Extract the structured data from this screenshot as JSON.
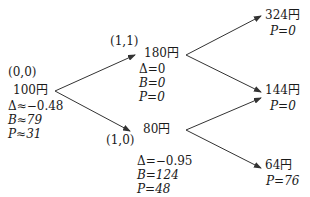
{
  "diagram": {
    "type": "binomial-tree",
    "nodes": {
      "root": {
        "coord": "(0,0)",
        "price": "100円",
        "delta": "Δ≈−0.48",
        "bond": "B≈79",
        "put": "P≈31"
      },
      "up": {
        "coord": "(1,1)",
        "price": "180円",
        "delta": "Δ=0",
        "bond": "B=0",
        "put": "P=0"
      },
      "down": {
        "coord": "(1,0)",
        "price": "80円",
        "delta": "Δ=−0.95",
        "bond": "B=124",
        "put": "P=48"
      },
      "uu": {
        "price": "324円",
        "put": "P=0"
      },
      "ud": {
        "price": "144円",
        "put": "P=0"
      },
      "dd": {
        "price": "64円",
        "put": "P=76"
      }
    },
    "edges": [
      {
        "from": "root",
        "to": "up"
      },
      {
        "from": "root",
        "to": "down"
      },
      {
        "from": "up",
        "to": "uu"
      },
      {
        "from": "up",
        "to": "ud"
      },
      {
        "from": "down",
        "to": "ud"
      },
      {
        "from": "down",
        "to": "dd"
      }
    ],
    "colors": {
      "line": "#333333",
      "text": "#1a1a1a"
    }
  }
}
